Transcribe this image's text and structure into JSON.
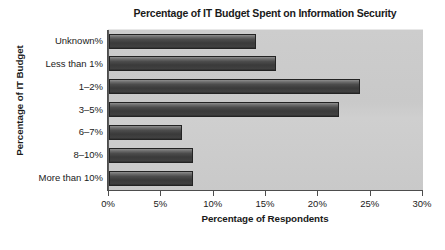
{
  "chart_data": {
    "type": "bar",
    "orientation": "horizontal",
    "title": "Percentage of IT Budget Spent on Information Security",
    "xlabel": "Percentage of Respondents",
    "ylabel": "Percentage of IT Budget",
    "categories": [
      "Unknown%",
      "Less than 1%",
      "1–2%",
      "3–5%",
      "6–7%",
      "8–10%",
      "More than 10%"
    ],
    "values": [
      14,
      16,
      24,
      22,
      7,
      8,
      8
    ],
    "xlim": [
      0,
      30
    ],
    "xticks": [
      0,
      5,
      10,
      15,
      20,
      25,
      30
    ],
    "xtick_labels": [
      "0%",
      "5%",
      "10%",
      "15%",
      "20%",
      "25%",
      "30%"
    ],
    "grid": false,
    "legend": null,
    "colors": {
      "plot_background": "#cacaca",
      "bar_light": "#8f8f8f",
      "bar_dark": "#333333",
      "bar_border": "#232323",
      "axis": "#4d4d4d",
      "text": "#1a1a1a",
      "figure_background": "#ffffff"
    }
  }
}
